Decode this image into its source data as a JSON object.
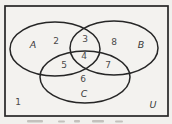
{
  "figure": {
    "type": "venn-diagram-three-sets",
    "universe_label": "U",
    "outside_label": "1",
    "set_labels": {
      "a": "A",
      "b": "B",
      "c": "C"
    },
    "region_labels": {
      "a_only": "2",
      "a_b": "3",
      "b_only": "8",
      "a_c": "5",
      "a_b_c": "4",
      "b_c": "7",
      "c_only": "6"
    },
    "colors": {
      "line": "#262626",
      "background": "#f1f0ed",
      "label": "#4a4a4a"
    }
  }
}
